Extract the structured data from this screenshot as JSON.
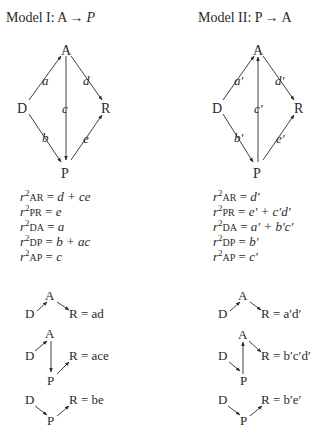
{
  "model1": {
    "title_prefix": "Model I: A",
    "title_arrow": "→",
    "title_suffix": "P",
    "nodes": {
      "A": "A",
      "D": "D",
      "R": "R",
      "P": "P"
    },
    "edges": {
      "a": "a",
      "b": "b",
      "c": "c",
      "d": "d",
      "e": "e"
    },
    "equations": [
      {
        "sub": "AR",
        "rhs": "d + ce"
      },
      {
        "sub": "PR",
        "rhs": "e"
      },
      {
        "sub": "DA",
        "rhs": "a"
      },
      {
        "sub": "DP",
        "rhs": "b + ac"
      },
      {
        "sub": "AP",
        "rhs": "c"
      }
    ],
    "paths": [
      {
        "result": "R = ad"
      },
      {
        "result": "R = ace"
      },
      {
        "result": "R = be"
      }
    ]
  },
  "model2": {
    "title_prefix": "Model II: P",
    "title_arrow": "→",
    "title_suffix": "A",
    "nodes": {
      "A": "A",
      "D": "D",
      "R": "R",
      "P": "P"
    },
    "edges": {
      "a": "a′",
      "b": "b′",
      "c": "c′",
      "d": "d′",
      "e": "e′"
    },
    "equations": [
      {
        "sub": "AR",
        "rhs": "d′"
      },
      {
        "sub": "PR",
        "rhs": "e′ + c′d′"
      },
      {
        "sub": "DA",
        "rhs": "a′ + b′c′"
      },
      {
        "sub": "DP",
        "rhs": "b′"
      },
      {
        "sub": "AP",
        "rhs": "c′"
      }
    ],
    "paths": [
      {
        "result": "R = a′d′"
      },
      {
        "result": "R = b′c′d′"
      },
      {
        "result": "R = b′e′"
      }
    ]
  },
  "r_symbol": "r",
  "r_power": "2",
  "eq_sign": " = "
}
